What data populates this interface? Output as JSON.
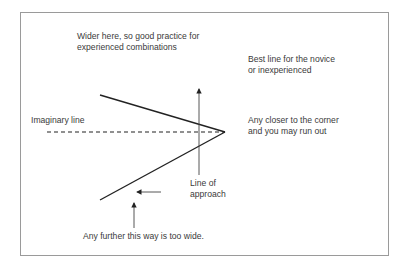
{
  "diagram": {
    "labels": {
      "wider": [
        "Wider here, so good practice for",
        "experienced combinations"
      ],
      "best_line": [
        "Best line for the novice",
        "or inexperienced"
      ],
      "imaginary": "Imaginary line",
      "closer": [
        "Any closer to the corner",
        "and you may run out"
      ],
      "approach": [
        "Line of",
        "approach"
      ],
      "too_wide": "Any further this way is too wide."
    },
    "colors": {
      "line": "#222222",
      "text": "#3a3a3a",
      "border": "#9a9a9a"
    }
  }
}
